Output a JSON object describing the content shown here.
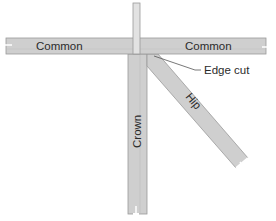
{
  "diagram": {
    "labels": {
      "common_left": "Common",
      "common_right": "Common",
      "crown": "Crown",
      "hip": "Hip",
      "edge_cut": "Edge cut"
    },
    "colors": {
      "board_fill": "#cfcfcf",
      "board_fill_light": "#e2e2e2",
      "board_edge": "#9a9a9a",
      "text": "#2b2b2b",
      "leader": "#555555",
      "background": "#ffffff"
    }
  }
}
